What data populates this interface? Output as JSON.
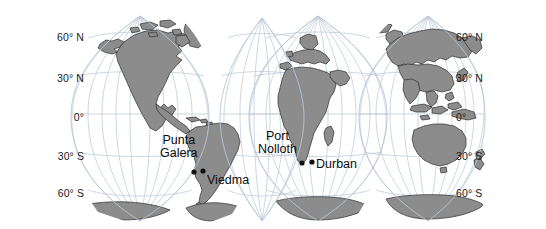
{
  "figure": {
    "projection": "interrupted-goode-homolosine",
    "background_color": "#ffffff",
    "land_fill_color": "#8c8c8c",
    "land_stroke_color": "#2e2e2e",
    "graticule_color": "#b9c6d6",
    "label_color": "#1b1b1b",
    "marker_color": "#111111"
  },
  "latitude_axis": {
    "labels_left": [
      {
        "text": "60° N",
        "value": 60,
        "x": 84,
        "y": 38
      },
      {
        "text": "30° N",
        "value": 30,
        "x": 84,
        "y": 79
      },
      {
        "text": "0°",
        "value": 0,
        "x": 84,
        "y": 118
      },
      {
        "text": "30° S",
        "value": -30,
        "x": 84,
        "y": 157
      },
      {
        "text": "60° S",
        "value": -60,
        "x": 84,
        "y": 194
      }
    ],
    "labels_right": [
      {
        "text": "60° N",
        "value": 60,
        "x": 456,
        "y": 38
      },
      {
        "text": "30° N",
        "value": 30,
        "x": 456,
        "y": 79
      },
      {
        "text": "0°",
        "value": 0,
        "x": 456,
        "y": 118
      },
      {
        "text": "30° S",
        "value": -30,
        "x": 456,
        "y": 157
      },
      {
        "text": "60° S",
        "value": -60,
        "x": 456,
        "y": 194
      }
    ]
  },
  "city_markers": [
    {
      "name": "Punta Galera",
      "label_lines": [
        "Punta",
        "Galera"
      ],
      "label_x": 160,
      "label_y": 134,
      "dot_x": 194,
      "dot_y": 172
    },
    {
      "name": "Viedma",
      "label_lines": [
        "Viedma"
      ],
      "label_x": 207,
      "label_y": 174,
      "dot_x": 203,
      "dot_y": 171
    },
    {
      "name": "Port Nolloth",
      "label_lines": [
        "Port",
        "Nolloth"
      ],
      "label_x": 258,
      "label_y": 130,
      "dot_x": 302,
      "dot_y": 163
    },
    {
      "name": "Durban",
      "label_lines": [
        "Durban"
      ],
      "label_x": 316,
      "label_y": 158,
      "dot_x": 312,
      "dot_y": 162
    }
  ]
}
